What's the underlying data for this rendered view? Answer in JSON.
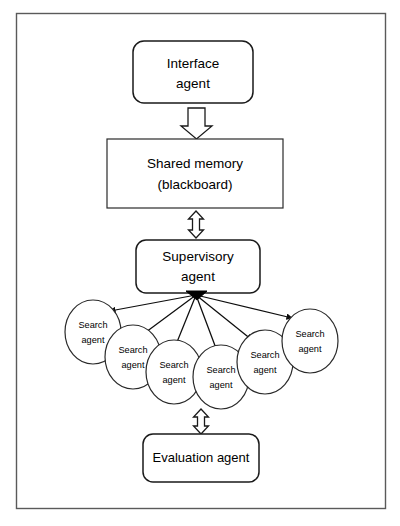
{
  "diagram": {
    "background_color": "#ffffff",
    "frame": {
      "name": "outer-frame",
      "stroke_color": "#5a5a5a"
    },
    "nodes": {
      "interface_agent": {
        "label_line1": "Interface",
        "label_line2": "agent",
        "shape": "rounded-rectangle"
      },
      "shared_memory": {
        "label_line1": "Shared memory",
        "label_line2": "(blackboard)",
        "shape": "rectangle"
      },
      "supervisory_agent": {
        "label_line1": "Supervisory",
        "label_line2": "agent",
        "shape": "rounded-rectangle"
      },
      "evaluation_agent": {
        "label_line1": "Evaluation agent",
        "label_line2": "",
        "shape": "rounded-rectangle"
      }
    },
    "search_agents": [
      {
        "id": "search-agent-1",
        "label_line1": "Search",
        "label_line2": "agent"
      },
      {
        "id": "search-agent-2",
        "label_line1": "Search",
        "label_line2": "agent"
      },
      {
        "id": "search-agent-3",
        "label_line1": "Search",
        "label_line2": "agent"
      },
      {
        "id": "search-agent-4",
        "label_line1": "Search",
        "label_line2": "agent"
      },
      {
        "id": "search-agent-5",
        "label_line1": "Search",
        "label_line2": "agent"
      },
      {
        "id": "search-agent-6",
        "label_line1": "Search",
        "label_line2": "agent"
      }
    ],
    "connectors": [
      {
        "id": "connector-interface-to-memory",
        "name": "block-arrow-down-icon",
        "direction": "down",
        "from": "interface_agent",
        "to": "shared_memory"
      },
      {
        "id": "connector-memory-to-supervisory",
        "name": "block-arrow-double-vertical-icon",
        "direction": "bidirectional",
        "from": "shared_memory",
        "to": "supervisory_agent"
      },
      {
        "id": "connector-supervisory-to-search-agents",
        "name": "fan-arrows-icon",
        "direction": "down-fan",
        "from": "supervisory_agent",
        "to": "search_agents",
        "count": 6
      },
      {
        "id": "connector-search-to-evaluation",
        "name": "block-arrow-double-vertical-icon",
        "direction": "bidirectional",
        "from": "search_agents",
        "to": "evaluation_agent"
      }
    ]
  }
}
